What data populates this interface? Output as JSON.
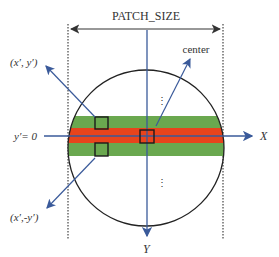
{
  "diagram": {
    "title_label": "PATCH_SIZE",
    "center_label": "center",
    "point_upper_label": "(x′, y′)",
    "point_lower_label": "(x′,-y′)",
    "y_zero_label": "y′= 0",
    "x_axis_label": "X",
    "y_axis_label": "Y",
    "ellipsis_upper": "⋮",
    "ellipsis_lower": "⋮",
    "colors": {
      "band_green": "#6aa84f",
      "band_red": "#e8441c",
      "axis_blue": "#3a5a9a",
      "outline": "#222222",
      "dotted": "#444444"
    }
  }
}
